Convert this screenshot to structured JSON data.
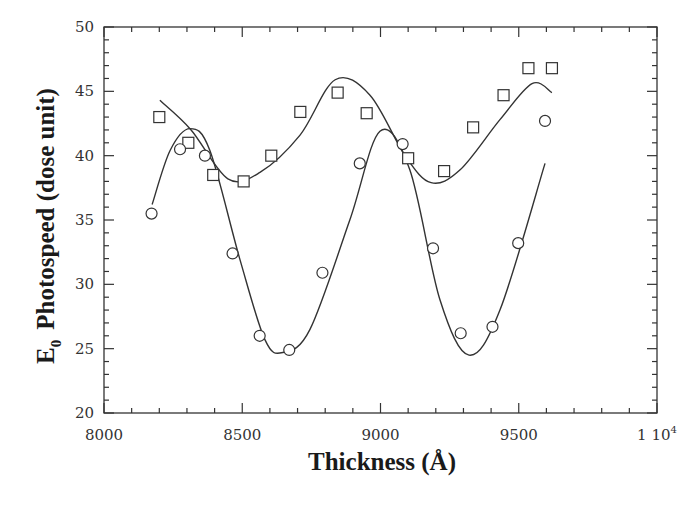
{
  "chart_data": {
    "type": "scatter",
    "title": "",
    "xlabel": "Thickness (Å)",
    "ylabel": "E0 Photospeed (dose unit)",
    "ylabel_parts": {
      "symbol": "E",
      "subscript": "0",
      "rest": "Photospeed (dose unit)"
    },
    "xlim": [
      8000,
      10000
    ],
    "ylim": [
      20,
      50
    ],
    "x_ticks": [
      8000,
      8500,
      9000,
      9500,
      10000
    ],
    "x_tick_labels": [
      "8000",
      "8500",
      "9000",
      "9500",
      "1 10"
    ],
    "x_tick_label_last_superscript": "4",
    "y_ticks": [
      20,
      25,
      30,
      35,
      40,
      45,
      50
    ],
    "y_tick_labels": [
      "20",
      "25",
      "30",
      "35",
      "40",
      "45",
      "50"
    ],
    "grid": false,
    "legend": null,
    "series": [
      {
        "name": "squares",
        "marker": "square",
        "points": [
          [
            8200,
            43.0
          ],
          [
            8305,
            41.0
          ],
          [
            8395,
            38.5
          ],
          [
            8505,
            38.0
          ],
          [
            8605,
            40.0
          ],
          [
            8710,
            43.4
          ],
          [
            8845,
            44.9
          ],
          [
            8950,
            43.3
          ],
          [
            9100,
            39.8
          ],
          [
            9230,
            38.8
          ],
          [
            9335,
            42.2
          ],
          [
            9445,
            44.7
          ],
          [
            9535,
            46.8
          ],
          [
            9620,
            46.8
          ]
        ],
        "fit_curve": [
          [
            8202,
            44.3
          ],
          [
            8315,
            42.0
          ],
          [
            8448,
            38.2
          ],
          [
            8564,
            38.7
          ],
          [
            8709,
            41.6
          ],
          [
            8836,
            45.9
          ],
          [
            8962,
            44.7
          ],
          [
            9089,
            40.0
          ],
          [
            9183,
            37.9
          ],
          [
            9288,
            38.9
          ],
          [
            9432,
            42.8
          ],
          [
            9548,
            45.6
          ],
          [
            9620,
            44.9
          ]
        ]
      },
      {
        "name": "circles",
        "marker": "circle",
        "points": [
          [
            8172,
            35.5
          ],
          [
            8275,
            40.5
          ],
          [
            8365,
            40.0
          ],
          [
            8465,
            32.4
          ],
          [
            8563,
            26.0
          ],
          [
            8670,
            24.9
          ],
          [
            8790,
            30.9
          ],
          [
            8925,
            39.4
          ],
          [
            9080,
            40.9
          ],
          [
            9190,
            32.8
          ],
          [
            9290,
            26.2
          ],
          [
            9405,
            26.7
          ],
          [
            9498,
            33.2
          ],
          [
            9595,
            42.7
          ]
        ],
        "fit_curve": [
          [
            8174,
            36.2
          ],
          [
            8239,
            40.4
          ],
          [
            8311,
            42.1
          ],
          [
            8383,
            40.4
          ],
          [
            8492,
            31.9
          ],
          [
            8582,
            25.7
          ],
          [
            8647,
            24.7
          ],
          [
            8745,
            26.5
          ],
          [
            8889,
            35.0
          ],
          [
            8998,
            41.9
          ],
          [
            9106,
            38.9
          ],
          [
            9215,
            28.8
          ],
          [
            9320,
            24.5
          ],
          [
            9432,
            28.0
          ],
          [
            9595,
            39.4
          ]
        ]
      }
    ]
  }
}
